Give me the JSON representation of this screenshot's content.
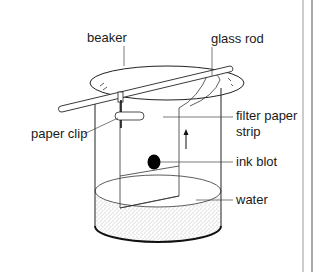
{
  "diagram": {
    "labels": {
      "beaker": "beaker",
      "glass_rod": "glass rod",
      "paper_clip": "paper clip",
      "filter_paper_line1": "filter paper",
      "filter_paper_line2": "strip",
      "ink_blot": "ink blot",
      "water": "water"
    },
    "colors": {
      "line": "#222222",
      "ink": "#000000",
      "background": "#ffffff",
      "page_border": "#555555"
    }
  }
}
